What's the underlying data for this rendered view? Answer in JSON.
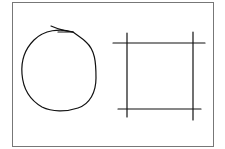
{
  "figure": {
    "background": "#ffffff",
    "frame_color": "#777777",
    "stroke_color": "#111111",
    "shapes": [
      {
        "name": "hand-drawn-circle"
      },
      {
        "name": "square-of-crossing-lines"
      }
    ]
  }
}
